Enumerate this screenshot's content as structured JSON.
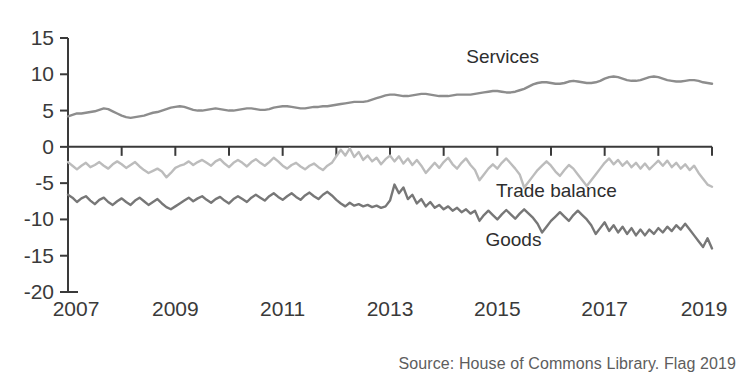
{
  "source_note": "Source: House of Commons Library. Flag 2019",
  "chart_data": {
    "type": "line",
    "title": "",
    "subtitle": "",
    "xlabel": "",
    "ylabel": "",
    "grid": false,
    "legend_position": "inline-annotations",
    "xlim": [
      2007.0,
      2019.0
    ],
    "ylim": [
      -20,
      15
    ],
    "y_ticks": [
      15,
      10,
      5,
      0,
      -5,
      -10,
      -15,
      -20
    ],
    "y_tick_labels": [
      "15",
      "10",
      "5",
      "0",
      "-5",
      "-10",
      "-15",
      "-20"
    ],
    "x_ticks": [
      2007,
      2008,
      2009,
      2010,
      2011,
      2012,
      2013,
      2014,
      2015,
      2016,
      2017,
      2018,
      2019
    ],
    "x_tick_labels_shown": [
      "2007",
      "2009",
      "2011",
      "2013",
      "2015",
      "2017",
      "2019"
    ],
    "x_label_years": [
      2007,
      2009,
      2011,
      2013,
      2015,
      2017,
      2019
    ],
    "annotations": [
      {
        "text": "Services",
        "x": 2015.1,
        "y": 11.6
      },
      {
        "text": "Trade balance",
        "x": 2016.1,
        "y": -6.9
      },
      {
        "text": "Goods",
        "x": 2015.3,
        "y": -13.6
      }
    ],
    "series": [
      {
        "name": "Services",
        "color": "#8d8d8d",
        "x_start": 2007.0,
        "x_step": 0.0833333,
        "values": [
          4.2,
          4.4,
          4.6,
          4.6,
          4.7,
          4.8,
          4.9,
          5.1,
          5.3,
          5.2,
          4.9,
          4.6,
          4.3,
          4.1,
          4.0,
          4.1,
          4.2,
          4.3,
          4.5,
          4.7,
          4.8,
          5.0,
          5.2,
          5.4,
          5.5,
          5.6,
          5.5,
          5.3,
          5.1,
          5.0,
          5.0,
          5.1,
          5.2,
          5.3,
          5.2,
          5.1,
          5.0,
          5.0,
          5.1,
          5.2,
          5.3,
          5.3,
          5.2,
          5.1,
          5.1,
          5.2,
          5.4,
          5.5,
          5.6,
          5.6,
          5.5,
          5.4,
          5.3,
          5.3,
          5.4,
          5.5,
          5.5,
          5.6,
          5.6,
          5.7,
          5.8,
          5.9,
          6.0,
          6.1,
          6.2,
          6.2,
          6.2,
          6.3,
          6.5,
          6.7,
          6.9,
          7.1,
          7.2,
          7.2,
          7.1,
          7.0,
          7.0,
          7.1,
          7.2,
          7.3,
          7.3,
          7.2,
          7.1,
          7.0,
          7.0,
          7.0,
          7.1,
          7.2,
          7.2,
          7.2,
          7.2,
          7.3,
          7.4,
          7.5,
          7.6,
          7.7,
          7.7,
          7.6,
          7.5,
          7.5,
          7.6,
          7.8,
          8.0,
          8.3,
          8.6,
          8.8,
          8.9,
          8.9,
          8.8,
          8.7,
          8.7,
          8.8,
          9.0,
          9.1,
          9.0,
          8.9,
          8.8,
          8.8,
          8.9,
          9.1,
          9.4,
          9.6,
          9.7,
          9.6,
          9.4,
          9.2,
          9.1,
          9.1,
          9.2,
          9.4,
          9.6,
          9.7,
          9.6,
          9.4,
          9.2,
          9.1,
          9.0,
          9.0,
          9.1,
          9.2,
          9.2,
          9.1,
          8.9,
          8.8,
          8.7
        ]
      },
      {
        "name": "Trade balance",
        "color": "#bcbcbc",
        "x_start": 2007.0,
        "x_step": 0.0833333,
        "values": [
          -2.1,
          -2.6,
          -3.1,
          -2.6,
          -2.2,
          -2.8,
          -2.5,
          -2.1,
          -2.6,
          -3.0,
          -2.4,
          -2.0,
          -2.4,
          -2.9,
          -2.5,
          -2.1,
          -2.7,
          -3.2,
          -3.6,
          -3.3,
          -3.0,
          -3.4,
          -4.2,
          -3.6,
          -2.9,
          -2.6,
          -2.4,
          -2.0,
          -2.5,
          -2.1,
          -1.8,
          -2.2,
          -2.6,
          -2.0,
          -1.7,
          -2.3,
          -2.8,
          -2.2,
          -1.8,
          -2.2,
          -2.7,
          -2.1,
          -1.7,
          -2.2,
          -2.6,
          -2.1,
          -1.5,
          -2.0,
          -2.6,
          -3.0,
          -2.5,
          -2.2,
          -2.7,
          -3.1,
          -2.6,
          -2.3,
          -2.8,
          -3.2,
          -2.6,
          -2.2,
          -1.3,
          -0.4,
          -1.2,
          -0.2,
          -1.4,
          -0.7,
          -1.8,
          -1.2,
          -2.0,
          -1.5,
          -2.4,
          -1.7,
          -1.2,
          -2.0,
          -1.3,
          -2.3,
          -1.6,
          -2.5,
          -1.8,
          -2.6,
          -3.6,
          -2.9,
          -2.2,
          -2.9,
          -2.1,
          -1.5,
          -2.4,
          -3.0,
          -2.2,
          -1.6,
          -2.5,
          -3.2,
          -4.6,
          -3.8,
          -3.0,
          -2.4,
          -3.0,
          -2.2,
          -1.6,
          -2.3,
          -3.0,
          -3.8,
          -5.6,
          -4.8,
          -4.0,
          -3.2,
          -2.6,
          -2.0,
          -2.6,
          -3.4,
          -4.0,
          -3.2,
          -2.5,
          -3.0,
          -3.8,
          -4.6,
          -5.4,
          -4.6,
          -3.8,
          -3.0,
          -2.2,
          -1.6,
          -2.4,
          -1.8,
          -2.6,
          -2.0,
          -2.8,
          -2.2,
          -3.0,
          -2.3,
          -3.1,
          -2.5,
          -1.9,
          -2.6,
          -1.9,
          -2.8,
          -2.2,
          -3.0,
          -2.4,
          -3.2,
          -2.6,
          -3.6,
          -4.4,
          -5.2,
          -5.5
        ]
      },
      {
        "name": "Goods",
        "color": "#777777",
        "x_start": 2007.0,
        "x_step": 0.0833333,
        "values": [
          -6.6,
          -7.0,
          -7.6,
          -7.1,
          -6.8,
          -7.4,
          -7.9,
          -7.3,
          -7.0,
          -7.6,
          -8.0,
          -7.5,
          -7.1,
          -7.6,
          -8.0,
          -7.4,
          -7.0,
          -7.5,
          -8.0,
          -7.6,
          -7.2,
          -7.8,
          -8.3,
          -8.6,
          -8.2,
          -7.8,
          -7.4,
          -7.0,
          -7.5,
          -7.1,
          -6.8,
          -7.3,
          -7.7,
          -7.2,
          -6.9,
          -7.4,
          -7.8,
          -7.2,
          -6.8,
          -7.2,
          -7.6,
          -7.0,
          -6.6,
          -7.0,
          -7.4,
          -6.8,
          -6.4,
          -6.9,
          -7.3,
          -6.8,
          -6.4,
          -6.9,
          -7.3,
          -6.7,
          -6.3,
          -6.8,
          -7.2,
          -6.6,
          -6.2,
          -6.7,
          -7.3,
          -7.8,
          -8.2,
          -7.7,
          -8.1,
          -7.9,
          -8.2,
          -8.0,
          -8.3,
          -8.1,
          -8.4,
          -8.2,
          -7.4,
          -5.2,
          -6.4,
          -5.6,
          -7.2,
          -6.6,
          -7.8,
          -7.2,
          -8.2,
          -7.6,
          -8.4,
          -8.0,
          -8.6,
          -8.2,
          -8.8,
          -8.4,
          -9.0,
          -8.6,
          -9.2,
          -8.8,
          -10.2,
          -9.4,
          -8.8,
          -9.4,
          -10.0,
          -9.3,
          -8.7,
          -9.3,
          -9.9,
          -9.2,
          -8.6,
          -9.2,
          -9.8,
          -10.6,
          -11.8,
          -11.0,
          -10.2,
          -9.6,
          -9.0,
          -9.6,
          -10.2,
          -9.4,
          -8.8,
          -9.4,
          -10.0,
          -10.8,
          -12.0,
          -11.2,
          -10.4,
          -11.6,
          -10.8,
          -11.8,
          -11.0,
          -12.0,
          -11.2,
          -12.2,
          -11.4,
          -12.2,
          -11.4,
          -12.0,
          -11.2,
          -11.8,
          -11.0,
          -11.6,
          -10.8,
          -11.4,
          -10.6,
          -11.4,
          -12.2,
          -13.0,
          -13.8,
          -12.6,
          -14.0
        ]
      }
    ]
  }
}
